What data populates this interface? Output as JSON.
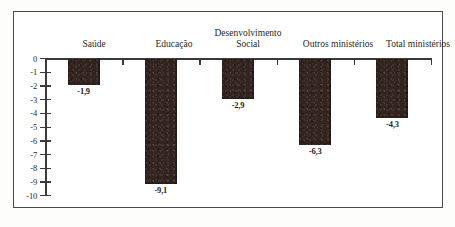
{
  "chart_data": {
    "type": "bar",
    "title": "",
    "subtitle": "",
    "xlabel": "",
    "ylabel": "",
    "categories": [
      "Saúde",
      "Educação",
      "Desenvolvimento Social",
      "Outros ministérios",
      "Total ministérios"
    ],
    "values": [
      -1.9,
      -9.1,
      -2.9,
      -6.3,
      -4.3
    ],
    "data_labels": [
      "-1,9",
      "-9,1",
      "-2,9",
      "-6,3",
      "-4,3"
    ],
    "ylim": [
      -10,
      0
    ],
    "ytick_labels": [
      "0",
      "-1",
      "-2",
      "-3",
      "-4",
      "-5",
      "-6",
      "-7",
      "-8",
      "-9",
      "-10"
    ],
    "ytick_values": [
      0,
      -1,
      -2,
      -3,
      -4,
      -5,
      -6,
      -7,
      -8,
      -9,
      -10
    ],
    "grid": false,
    "legend": null,
    "bar_color": "#33241f",
    "axis_color": "#3a3a3a",
    "frame_color": "#4a4a4a",
    "background": "#ffffff",
    "decimal_separator": ","
  },
  "labels": {
    "saude": "Saúde",
    "educacao": "Educação",
    "desenvolvimento_line1": "Desenvolvimento",
    "desenvolvimento_line2": "Social",
    "outros": "Outros ministérios",
    "total": "Total ministérios"
  },
  "caption": {
    "scrap_text": ""
  }
}
